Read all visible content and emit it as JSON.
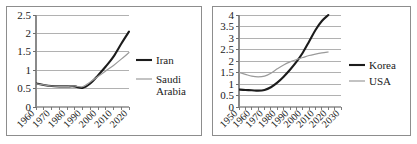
{
  "figure": {
    "panel_count": 2,
    "border_color": "#8d8d8d",
    "background": "#ffffff"
  },
  "chart_data": [
    {
      "id": "left",
      "type": "line",
      "title": "",
      "xlabel": "",
      "ylabel": "",
      "grid": true,
      "legend_position": "right",
      "xlim": [
        1960,
        2020
      ],
      "ylim": [
        0,
        2.5
      ],
      "x_ticks": [
        "1960",
        "1970",
        "1980",
        "1990",
        "2000",
        "2010",
        "2020"
      ],
      "y_ticks": [
        "0",
        "0.5",
        "1",
        "1.5",
        "2",
        "2.5"
      ],
      "x": [
        1960,
        1965,
        1970,
        1975,
        1980,
        1985,
        1990,
        1995,
        2000,
        2005,
        2010,
        2015,
        2020
      ],
      "series": [
        {
          "name": "Iran",
          "color": "#1c1c1c",
          "width": 2.1,
          "values": [
            0.64,
            0.6,
            0.57,
            0.56,
            0.56,
            0.56,
            0.52,
            0.64,
            0.86,
            1.1,
            1.37,
            1.72,
            2.05
          ]
        },
        {
          "name": "Saudi Arabia",
          "color": "#9a9a9a",
          "width": 1.2,
          "values": [
            0.63,
            0.6,
            0.57,
            0.56,
            0.56,
            0.57,
            0.55,
            0.68,
            0.83,
            0.98,
            1.13,
            1.3,
            1.48
          ]
        }
      ]
    },
    {
      "id": "right",
      "type": "line",
      "title": "",
      "xlabel": "",
      "ylabel": "",
      "grid": true,
      "legend_position": "right",
      "xlim": [
        1950,
        2030
      ],
      "ylim": [
        0,
        4
      ],
      "x_ticks": [
        "1950",
        "1960",
        "1970",
        "1980",
        "1990",
        "2000",
        "2010",
        "2020",
        "2030"
      ],
      "y_ticks": [
        "0",
        "0.5",
        "1",
        "1.5",
        "2",
        "2.5",
        "3",
        "3.5",
        "4"
      ],
      "x": [
        1950,
        1955,
        1960,
        1965,
        1970,
        1975,
        1980,
        1985,
        1990,
        1995,
        2000,
        2005,
        2010,
        2015,
        2020
      ],
      "series": [
        {
          "name": "Korea",
          "color": "#1c1c1c",
          "width": 2.1,
          "values": [
            0.76,
            0.74,
            0.73,
            0.71,
            0.74,
            0.86,
            1.06,
            1.32,
            1.62,
            1.96,
            2.36,
            2.85,
            3.35,
            3.74,
            4.0
          ]
        },
        {
          "name": "USA",
          "color": "#9a9a9a",
          "width": 1.2,
          "values": [
            1.5,
            1.42,
            1.34,
            1.31,
            1.34,
            1.47,
            1.66,
            1.83,
            1.96,
            2.06,
            2.15,
            2.24,
            2.3,
            2.35,
            2.39
          ]
        }
      ]
    }
  ],
  "legends": [
    {
      "panel": "left",
      "entries": [
        {
          "label": "Iran",
          "color": "#1c1c1c",
          "width": 2.1
        },
        {
          "label": "Saudi",
          "label2": "Arabia",
          "color": "#9a9a9a",
          "width": 1.2
        }
      ]
    },
    {
      "panel": "right",
      "entries": [
        {
          "label": "Korea",
          "color": "#1c1c1c",
          "width": 2.1
        },
        {
          "label": "USA",
          "color": "#9a9a9a",
          "width": 1.2
        }
      ]
    }
  ]
}
